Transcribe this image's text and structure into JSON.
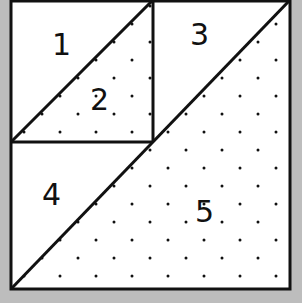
{
  "diagram": {
    "type": "quilt-block",
    "colors": {
      "background": "#bdbdbd",
      "fabric": "#ffffff",
      "line": "#111111",
      "dot": "#111111"
    },
    "pieces": [
      {
        "id": "1",
        "label": "1",
        "pattern": "plain"
      },
      {
        "id": "2",
        "label": "2",
        "pattern": "dotted"
      },
      {
        "id": "3",
        "label": "3",
        "pattern": "plain"
      },
      {
        "id": "4",
        "label": "4",
        "pattern": "plain"
      },
      {
        "id": "5",
        "label": "5",
        "pattern": "dotted"
      }
    ]
  }
}
